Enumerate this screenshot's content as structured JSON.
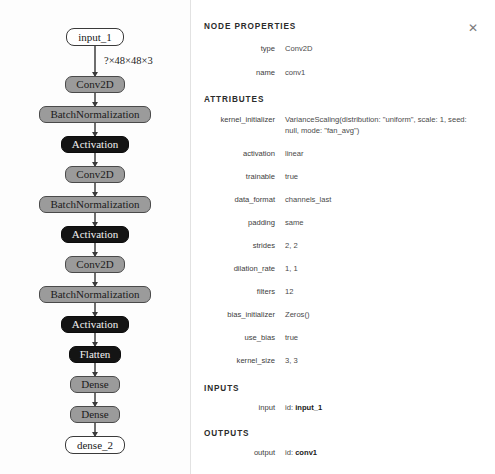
{
  "graph": {
    "input_edge_label": "?×48×48×3",
    "nodes": [
      {
        "label": "input_1",
        "kind": "io"
      },
      {
        "label": "Conv2D",
        "kind": "gray"
      },
      {
        "label": "BatchNormalization",
        "kind": "gray"
      },
      {
        "label": "Activation",
        "kind": "dark"
      },
      {
        "label": "Conv2D",
        "kind": "gray"
      },
      {
        "label": "BatchNormalization",
        "kind": "gray"
      },
      {
        "label": "Activation",
        "kind": "dark"
      },
      {
        "label": "Conv2D",
        "kind": "gray"
      },
      {
        "label": "BatchNormalization",
        "kind": "gray"
      },
      {
        "label": "Activation",
        "kind": "dark"
      },
      {
        "label": "Flatten",
        "kind": "dark"
      },
      {
        "label": "Dense",
        "kind": "gray"
      },
      {
        "label": "Dense",
        "kind": "gray"
      },
      {
        "label": "dense_2",
        "kind": "io"
      }
    ]
  },
  "panel": {
    "title": "NODE PROPERTIES",
    "close_label": "✕",
    "basic": [
      {
        "name": "type",
        "value": "Conv2D"
      },
      {
        "name": "name",
        "value": "conv1"
      }
    ],
    "attributes_title": "ATTRIBUTES",
    "attributes": [
      {
        "name": "kernel_initializer",
        "value": "VarianceScaling(distribution: \"uniform\", scale: 1, seed: null, mode: \"fan_avg\")"
      },
      {
        "name": "activation",
        "value": "linear"
      },
      {
        "name": "trainable",
        "value": "true"
      },
      {
        "name": "data_format",
        "value": "channels_last"
      },
      {
        "name": "padding",
        "value": "same"
      },
      {
        "name": "strides",
        "value": "2, 2"
      },
      {
        "name": "dilation_rate",
        "value": "1, 1"
      },
      {
        "name": "filters",
        "value": "12"
      },
      {
        "name": "bias_initializer",
        "value": "Zeros()"
      },
      {
        "name": "use_bias",
        "value": "true"
      },
      {
        "name": "kernel_size",
        "value": "3, 3"
      }
    ],
    "inputs_title": "INPUTS",
    "inputs": [
      {
        "name": "input",
        "id_label": "id:",
        "id_value": "input_1"
      }
    ],
    "outputs_title": "OUTPUTS",
    "outputs": [
      {
        "name": "output",
        "id_label": "id:",
        "id_value": "conv1"
      }
    ]
  },
  "colors": {
    "node_gray": "#9b9b9b",
    "node_dark": "#141414",
    "node_io": "#ffffff",
    "edge": "#6e6e6e",
    "divider": "#e2e2e2"
  }
}
